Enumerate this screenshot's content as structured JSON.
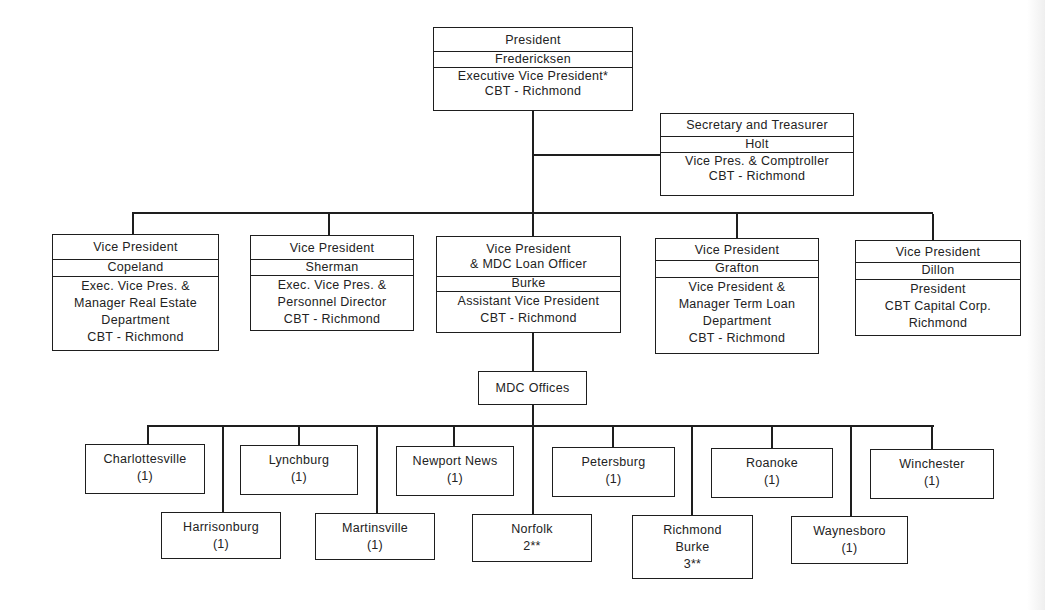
{
  "president": {
    "title": "President",
    "name": "Fredericksen",
    "role": [
      "Executive Vice President*",
      "CBT - Richmond"
    ]
  },
  "secretary": {
    "title": "Secretary and Treasurer",
    "name": "Holt",
    "role": [
      "Vice Pres. & Comptroller",
      "CBT - Richmond"
    ]
  },
  "vice_presidents": [
    {
      "title": [
        "Vice President"
      ],
      "name": "Copeland",
      "role": [
        "Exec. Vice Pres. &",
        "Manager Real Estate",
        "Department",
        "CBT - Richmond"
      ]
    },
    {
      "title": [
        "Vice President"
      ],
      "name": "Sherman",
      "role": [
        "Exec. Vice Pres. &",
        "Personnel Director",
        "CBT - Richmond"
      ]
    },
    {
      "title": [
        "Vice President",
        "& MDC Loan Officer"
      ],
      "name": "Burke",
      "role": [
        "Assistant Vice President",
        "CBT - Richmond"
      ]
    },
    {
      "title": [
        "Vice President"
      ],
      "name": "Grafton",
      "role": [
        "Vice President &",
        "Manager Term Loan",
        "Department",
        "CBT - Richmond"
      ]
    },
    {
      "title": [
        "Vice President"
      ],
      "name": "Dillon",
      "role": [
        "President",
        "CBT Capital Corp.",
        "Richmond"
      ]
    }
  ],
  "mdc_offices": {
    "label": "MDC Offices",
    "offices": [
      {
        "name": "Charlottesville",
        "count": "(1)"
      },
      {
        "name": "Harrisonburg",
        "count": "(1)"
      },
      {
        "name": "Lynchburg",
        "count": "(1)"
      },
      {
        "name": "Martinsville",
        "count": "(1)"
      },
      {
        "name": "Newport News",
        "count": "(1)"
      },
      {
        "name": "Norfolk",
        "count": "2**"
      },
      {
        "name": "Petersburg",
        "count": "(1)"
      },
      {
        "name": "Richmond",
        "manager": "Burke",
        "count": "3**"
      },
      {
        "name": "Roanoke",
        "count": "(1)"
      },
      {
        "name": "Waynesboro",
        "count": "(1)"
      },
      {
        "name": "Winchester",
        "count": "(1)"
      }
    ]
  }
}
